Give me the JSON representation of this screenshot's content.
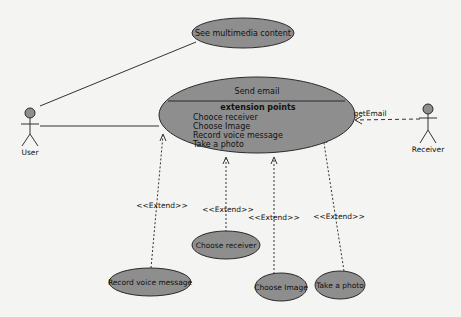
{
  "diagram": {
    "type": "UML use case diagram",
    "colors": {
      "background": "#f4f4f2",
      "use_case_fill": "#8e8e8e",
      "stroke": "#2a2a2a"
    },
    "actors": [
      {
        "id": "user",
        "label": "User"
      },
      {
        "id": "receiver",
        "label": "Receiver"
      }
    ],
    "use_cases": {
      "see_multimedia": {
        "label": "See multimedia content"
      },
      "send_email": {
        "label": "Send email",
        "extension_points_title": "extension points",
        "extension_points": [
          "Chooce receiver",
          "Choose Image",
          "Record voice message",
          "Take a photo"
        ]
      },
      "record_voice": {
        "label": "Record voice message"
      },
      "choose_receiver": {
        "label": "Choose receiver"
      },
      "choose_image": {
        "label": "Choose Image"
      },
      "take_photo": {
        "label": "Take a photo"
      }
    },
    "relations": {
      "get_email": "getEmail",
      "extend_1": "<<Extend>>",
      "extend_2": "<<Extend>>",
      "extend_3": "<<Extend>>",
      "extend_4": "<<Extend>>"
    }
  }
}
